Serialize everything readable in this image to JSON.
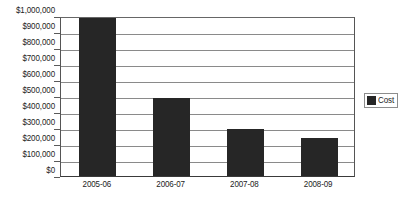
{
  "chart_data": {
    "type": "bar",
    "title": "",
    "subtitle": "",
    "xlabel": "",
    "ylabel": "",
    "categories": [
      "2005-06",
      "2006-07",
      "2007-08",
      "2008-09"
    ],
    "series": [
      {
        "name": "Cost",
        "values": [
          985000,
          490000,
          295000,
          235000
        ],
        "color": "#262626"
      }
    ],
    "ylim": [
      0,
      1000000
    ],
    "y_ticks": [
      0,
      100000,
      200000,
      300000,
      400000,
      500000,
      600000,
      700000,
      800000,
      900000,
      1000000
    ],
    "y_tick_labels": [
      "$0",
      "$100,000",
      "$200,000",
      "$300,000",
      "$400,000",
      "$500,000",
      "$600,000",
      "$700,000",
      "$800,000",
      "$900,000",
      "$1,000,000"
    ],
    "grid": "horizontal",
    "legend_position": "right",
    "legend_entries": [
      "Cost"
    ],
    "annotations": []
  },
  "legend": {
    "items": [
      {
        "label": "Cost",
        "color": "#262626"
      }
    ]
  },
  "colors": {
    "bar": "#262626",
    "gridline": "#8a8a8a",
    "axis": "#3a3a3a",
    "text": "#1c1c1c",
    "background": "#ffffff"
  }
}
